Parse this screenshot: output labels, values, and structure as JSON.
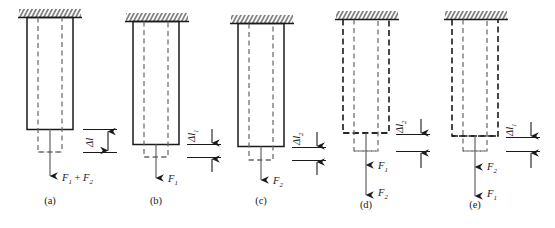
{
  "figure": {
    "background": "#ffffff",
    "stroke_color": "#1a1a1a",
    "dash_color": "#555555"
  },
  "panels": [
    {
      "id": "a",
      "caption": "(a)",
      "outline_style": "solid",
      "forces": [
        {
          "symbol": "F",
          "sub": "1",
          "op": " + ",
          "symbol2": "F",
          "sub2": "2",
          "label": "F1 + F2"
        }
      ],
      "elongation": {
        "symbol": "Δ",
        "italic": "l",
        "sub": "",
        "label": "Δl",
        "size": "large"
      }
    },
    {
      "id": "b",
      "caption": "(b)",
      "outline_style": "solid",
      "forces": [
        {
          "symbol": "F",
          "sub": "1",
          "label": "F1"
        }
      ],
      "elongation": {
        "symbol": "Δ",
        "italic": "l",
        "sub": "1",
        "label": "Δl₁",
        "size": "small"
      }
    },
    {
      "id": "c",
      "caption": "(c)",
      "outline_style": "solid",
      "forces": [
        {
          "symbol": "F",
          "sub": "2",
          "label": "F2"
        }
      ],
      "elongation": {
        "symbol": "Δ",
        "italic": "l",
        "sub": "2",
        "label": "Δl₂",
        "size": "small"
      }
    },
    {
      "id": "d",
      "caption": "(d)",
      "outline_style": "dashed",
      "forces": [
        {
          "symbol": "F",
          "sub": "1",
          "label": "F1"
        },
        {
          "symbol": "F",
          "sub": "2",
          "label": "F2"
        }
      ],
      "elongation": {
        "symbol": "Δ",
        "italic": "l",
        "sub": "2",
        "label": "Δl₂",
        "size": "small"
      }
    },
    {
      "id": "e",
      "caption": "(e)",
      "outline_style": "dashed",
      "forces": [
        {
          "symbol": "F",
          "sub": "2",
          "label": "F2"
        },
        {
          "symbol": "F",
          "sub": "1",
          "label": "F1"
        }
      ],
      "elongation": {
        "symbol": "Δ",
        "italic": "l",
        "sub": "1",
        "label": "Δl₁",
        "size": "small"
      }
    }
  ]
}
